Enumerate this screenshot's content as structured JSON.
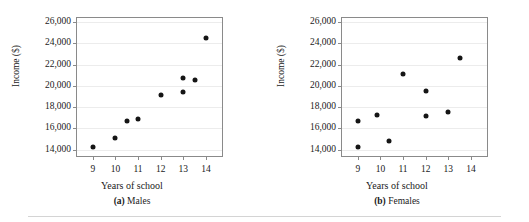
{
  "figure": {
    "bottom_rule": true,
    "dot_color": "#151515",
    "axis_color": "#8a8a8a",
    "grid_color": "#ececec"
  },
  "chart_data": [
    {
      "type": "scatter",
      "title": "",
      "caption_label": "(a)",
      "caption_text": "Males",
      "xlabel": "Years of school",
      "ylabel": "Income ($)",
      "xlim": [
        8.3,
        14.8
      ],
      "ylim": [
        13200,
        26400
      ],
      "xticks": [
        9,
        10,
        11,
        12,
        13,
        14
      ],
      "xticklabels": [
        "9",
        "10",
        "11",
        "12",
        "13",
        "14"
      ],
      "yticks": [
        14000,
        16000,
        18000,
        20000,
        22000,
        24000,
        26000
      ],
      "yticklabels": [
        "14,000",
        "16,000",
        "18,000",
        "20,000",
        "22,000",
        "24,000",
        "26,000"
      ],
      "grid": true,
      "legend": "none",
      "points": [
        {
          "x": 9.0,
          "y": 14200
        },
        {
          "x": 10.0,
          "y": 15100
        },
        {
          "x": 10.5,
          "y": 16650
        },
        {
          "x": 11.0,
          "y": 16900
        },
        {
          "x": 12.0,
          "y": 19150
        },
        {
          "x": 13.0,
          "y": 20700
        },
        {
          "x": 13.0,
          "y": 19400
        },
        {
          "x": 13.5,
          "y": 20550
        },
        {
          "x": 14.0,
          "y": 24500
        }
      ]
    },
    {
      "type": "scatter",
      "title": "",
      "caption_label": "(b)",
      "caption_text": "Females",
      "xlabel": "Years of school",
      "ylabel": "Income ($)",
      "xlim": [
        8.3,
        14.8
      ],
      "ylim": [
        13200,
        26400
      ],
      "xticks": [
        9,
        10,
        11,
        12,
        13,
        14
      ],
      "xticklabels": [
        "9",
        "10",
        "11",
        "12",
        "13",
        "14"
      ],
      "yticks": [
        14000,
        16000,
        18000,
        20000,
        22000,
        24000,
        26000
      ],
      "yticklabels": [
        "14,000",
        "16,000",
        "18,000",
        "20,000",
        "22,000",
        "24,000",
        "26,000"
      ],
      "grid": true,
      "legend": "none",
      "points": [
        {
          "x": 9.0,
          "y": 16700
        },
        {
          "x": 9.0,
          "y": 14200
        },
        {
          "x": 9.85,
          "y": 17300
        },
        {
          "x": 10.4,
          "y": 14850
        },
        {
          "x": 11.0,
          "y": 21150
        },
        {
          "x": 12.0,
          "y": 19500
        },
        {
          "x": 12.0,
          "y": 17150
        },
        {
          "x": 13.0,
          "y": 17550
        },
        {
          "x": 13.5,
          "y": 22650
        }
      ]
    }
  ]
}
